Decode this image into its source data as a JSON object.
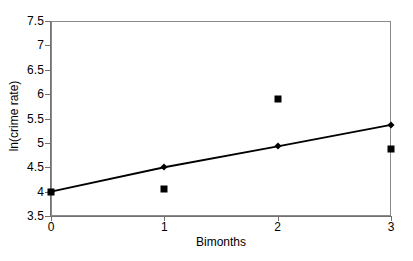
{
  "chart_data": {
    "type": "line",
    "title": "",
    "subtitle": "",
    "xlabel": "Bimonths",
    "ylabel": "ln(crime rate)",
    "xlim": [
      0,
      3
    ],
    "ylim": [
      3.5,
      7.5
    ],
    "xticks": [
      "0",
      "1",
      "2",
      "3"
    ],
    "xtick_values": [
      0,
      1,
      2,
      3
    ],
    "yticks": [
      "3.5",
      "4",
      "4.5",
      "5",
      "5.5",
      "6",
      "6.5",
      "7",
      "7.5"
    ],
    "ytick_values": [
      3.5,
      4,
      4.5,
      5,
      5.5,
      6,
      6.5,
      7,
      7.5
    ],
    "grid": false,
    "legend": "none",
    "x": [
      0,
      1,
      2,
      3
    ],
    "series": [
      {
        "name": "observed",
        "marker": "square",
        "line": false,
        "color": "#000000",
        "values": [
          3.99,
          4.06,
          5.9,
          4.88
        ]
      },
      {
        "name": "fitted",
        "marker": "diamond",
        "line": true,
        "color": "#000000",
        "values": [
          4.0,
          4.5,
          4.93,
          5.37
        ]
      }
    ],
    "annotations": []
  },
  "style": {
    "frame_color": "#8a8a8a",
    "axis_color": "#707070",
    "data_color": "#000000",
    "background": "#ffffff"
  }
}
